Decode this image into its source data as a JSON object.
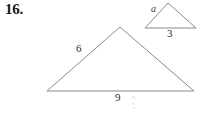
{
  "problem": {
    "number_label": "16."
  },
  "figures": {
    "small_triangle": {
      "name": "small-triangle",
      "vertices": {
        "apex": [
          168,
          3
        ],
        "left": [
          145,
          28
        ],
        "right": [
          196,
          28
        ]
      },
      "labels": {
        "left_side": "a",
        "base": "3"
      }
    },
    "large_triangle": {
      "name": "large-triangle",
      "vertices": {
        "apex": [
          120,
          27
        ],
        "bottom_left": [
          47,
          91
        ],
        "bottom_right": [
          194,
          91
        ]
      },
      "labels": {
        "left_side": "6",
        "base": "9"
      }
    }
  },
  "style": {
    "line_color": "#8a8a8a",
    "background": "#ffffff",
    "text_color": "#2a2a2a",
    "number_color": "#161616"
  }
}
